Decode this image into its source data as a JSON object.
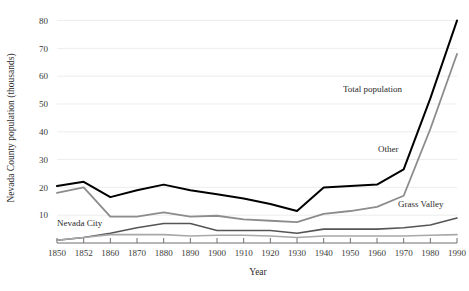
{
  "chart_data": {
    "type": "line",
    "title": "",
    "subtitle": "",
    "xlabel": "Year",
    "ylabel": "Nevada County population (thousands)",
    "categories": [
      "1850",
      "1852",
      "1860",
      "1870",
      "1880",
      "1890",
      "1900",
      "1910",
      "1920",
      "1930",
      "1940",
      "1950",
      "1960",
      "1970",
      "1980",
      "1990"
    ],
    "yticks": [
      10,
      20,
      30,
      40,
      50,
      60,
      70,
      80
    ],
    "ylim": [
      0,
      82
    ],
    "grid": "horizontal",
    "legend": "inline-annotations",
    "series": [
      {
        "name": "Total population",
        "color": "#000000",
        "width": 2.0,
        "label_x": 343,
        "label_y": 92,
        "values": [
          20.5,
          22.0,
          16.5,
          19.0,
          21.0,
          19.0,
          17.5,
          16.0,
          14.0,
          11.5,
          20.0,
          20.5,
          21.0,
          26.5,
          52.0,
          80.0
        ]
      },
      {
        "name": "Other",
        "color": "#8c8c8c",
        "width": 1.8,
        "label_x": 378,
        "label_y": 152,
        "values": [
          18.0,
          20.0,
          9.5,
          9.5,
          11.0,
          9.5,
          9.8,
          8.5,
          8.0,
          7.5,
          10.5,
          11.5,
          13.0,
          17.0,
          41.0,
          68.0
        ]
      },
      {
        "name": "Grass Valley",
        "color": "#555555",
        "width": 1.6,
        "label_x": 398,
        "label_y": 207,
        "values": [
          1.0,
          2.0,
          3.5,
          5.5,
          7.0,
          7.0,
          4.5,
          4.5,
          4.5,
          3.5,
          5.0,
          5.0,
          5.0,
          5.5,
          6.5,
          9.0
        ]
      },
      {
        "name": "Nevada City",
        "color": "#a8a8a8",
        "width": 1.6,
        "label_x": 57,
        "label_y": 226,
        "values": [
          1.0,
          2.0,
          3.0,
          3.0,
          3.0,
          2.5,
          2.8,
          2.8,
          2.5,
          2.0,
          2.5,
          2.5,
          2.5,
          2.5,
          2.8,
          3.0
        ]
      }
    ]
  },
  "colors": {
    "grid": "#ededed",
    "axis": "#6f6f6f",
    "text": "#2b2b2b",
    "background": "#ffffff"
  }
}
